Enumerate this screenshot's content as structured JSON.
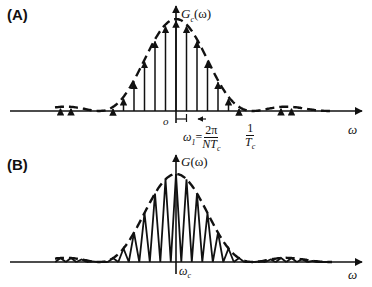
{
  "panels": [
    {
      "tag": "(A)",
      "y_label": "G",
      "y_label_sub": "c",
      "y_label_arg": "(ω)",
      "origin_label": "o",
      "x_label": "ω",
      "annotation_w1": {
        "lhs": "ω",
        "lhs_sub": "1",
        "eq": "=",
        "num": "2π",
        "den": "NT",
        "den_sub": "c"
      },
      "annotation_tc": {
        "num": "1",
        "den": "T",
        "den_sub": "c"
      },
      "description": "Discrete line spectrum (arrows) under a sinc-squared envelope (dashed)"
    },
    {
      "tag": "(B)",
      "y_label": "G",
      "y_label_sub": "",
      "y_label_arg": "(ω)",
      "origin_label": "ω",
      "origin_label_sub": "c",
      "x_label": "ω",
      "description": "Triangular-peak spectrum under the same envelope (dashed)"
    }
  ],
  "colors": {
    "ink": "#111111",
    "background": "#ffffff"
  }
}
